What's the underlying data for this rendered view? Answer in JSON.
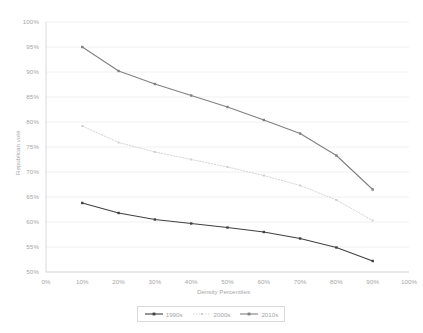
{
  "chart_data": {
    "type": "line",
    "title": "",
    "xlabel": "Density Percentiles",
    "ylabel": "Republican vote",
    "x": [
      10,
      20,
      30,
      40,
      50,
      60,
      70,
      80,
      90
    ],
    "xticklabels": [
      "0%",
      "10%",
      "20%",
      "30%",
      "40%",
      "50%",
      "60%",
      "70%",
      "80%",
      "90%",
      "100%"
    ],
    "xtickvalues": [
      0,
      10,
      20,
      30,
      40,
      50,
      60,
      70,
      80,
      90,
      100
    ],
    "yticklabels": [
      "50%",
      "55%",
      "60%",
      "65%",
      "70%",
      "75%",
      "80%",
      "85%",
      "90%",
      "95%",
      "100%"
    ],
    "ytickvalues": [
      50,
      55,
      60,
      65,
      70,
      75,
      80,
      85,
      90,
      95,
      100
    ],
    "xlim": [
      0,
      100
    ],
    "ylim": [
      50,
      100
    ],
    "grid": "horizontal",
    "legend_position": "bottom",
    "series": [
      {
        "name": "1990s",
        "color": "#404040",
        "style": "solid",
        "marker": "square",
        "values": [
          63.8,
          61.8,
          60.5,
          59.7,
          58.9,
          58.0,
          56.7,
          54.9,
          52.2
        ]
      },
      {
        "name": "2000s",
        "color": "#d0d0d0",
        "style": "dotted",
        "marker": "square",
        "values": [
          79.2,
          75.9,
          74.0,
          72.5,
          71.0,
          69.3,
          67.3,
          64.4,
          60.3
        ]
      },
      {
        "name": "2010s",
        "color": "#808080",
        "style": "solid",
        "marker": "square",
        "values": [
          95.0,
          90.2,
          87.6,
          85.3,
          83.0,
          80.4,
          77.7,
          73.3,
          66.5
        ]
      }
    ]
  },
  "legend": {
    "items": [
      {
        "label": "1990s"
      },
      {
        "label": "2000s"
      },
      {
        "label": "2010s"
      }
    ]
  },
  "colors": {
    "grid": "#f0f0f0",
    "axis": "#d9d9d9",
    "tick_text": "#a6a6a6",
    "series_1990s": "#404040",
    "series_2000s": "#d0d0d0",
    "series_2010s": "#808080"
  }
}
